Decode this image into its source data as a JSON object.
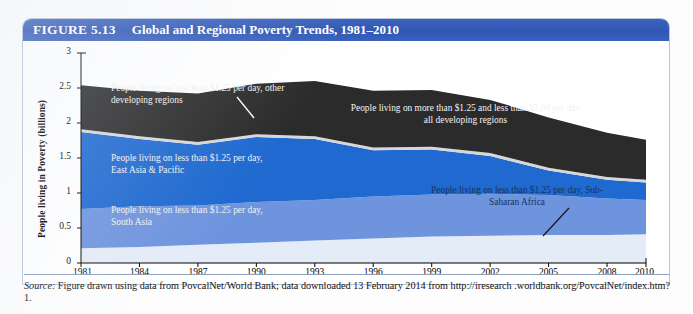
{
  "figure": {
    "label": "FIGURE 5.13",
    "title": "Global and Regional Poverty Trends, 1981–2010"
  },
  "source": {
    "prefix": "Source:",
    "text": " Figure drawn using data from PovcalNet/World Bank; data downloaded 13 February 2014 from http://iresearch .worldbank.org/PovcalNet/index.htm?1."
  },
  "colors": {
    "title_bar": "#2f56b4",
    "other_developing": "#2b2b2b",
    "separator_grey": "#d7d7d7",
    "east_asia_pacific": "#1f69d0",
    "south_asia": "#6f94de",
    "sub_saharan_africa": "#e4ecf8",
    "frame": "#b9c4d8"
  },
  "annotations": [
    {
      "name": "annot-other-developing",
      "text": "People living on less than $1.25 per day, other\ndeveloping regions",
      "style": "white",
      "left": 88,
      "top": 42,
      "width": 215,
      "align": "left"
    },
    {
      "name": "annot-above-125-below-200",
      "text": "People living on more than $1.25 and less than $2.00 per day\nall developing regions",
      "style": "white",
      "left": 300,
      "top": 62,
      "width": 285,
      "align": "center"
    },
    {
      "name": "annot-east-asia-pacific",
      "text": "People living on less than $1.25 per day,\nEast Asia & Pacific",
      "style": "white",
      "left": 88,
      "top": 112,
      "width": 215,
      "align": "left"
    },
    {
      "name": "annot-south-asia",
      "text": "People living on less than $1.25 per day,\nSouth Asia",
      "style": "white",
      "left": 88,
      "top": 164,
      "width": 215,
      "align": "left"
    },
    {
      "name": "annot-sub-saharan-africa",
      "text": "People living on less than $1.25 per day, Sub-\nSaharan Africa",
      "style": "dark",
      "left": 370,
      "top": 144,
      "width": 248,
      "align": "center"
    }
  ],
  "leaders": [
    {
      "name": "leader-other-developing",
      "x1": 214,
      "y1": 56,
      "x2": 231,
      "y2": 77
    },
    {
      "name": "leader-sub-saharan-africa",
      "x1": 546,
      "y1": 167,
      "x2": 520,
      "y2": 195
    }
  ],
  "chart_data": {
    "type": "area",
    "stacked": true,
    "title": "Global and Regional Poverty Trends, 1981–2010",
    "xlabel": "",
    "ylabel": "People living in Poverty (billions)",
    "xlim": [
      1981,
      2010
    ],
    "ylim": [
      0,
      3
    ],
    "grid": false,
    "legend_position": "in-plot annotations",
    "y_ticks": [
      "0",
      "0.5",
      "1",
      "1.5",
      "2",
      "2.5",
      "3"
    ],
    "y_tick_values": [
      0,
      0.5,
      1,
      1.5,
      2,
      2.5,
      3
    ],
    "x_ticks": [
      "1981",
      "1984",
      "1987",
      "1990",
      "1993",
      "1996",
      "1999",
      "2002",
      "2005",
      "2008",
      "2010"
    ],
    "x_tick_values": [
      1981,
      1984,
      1987,
      1990,
      1993,
      1996,
      1999,
      2002,
      2005,
      2008,
      2010
    ],
    "x": [
      1981,
      1984,
      1987,
      1990,
      1993,
      1996,
      1999,
      2002,
      2005,
      2008,
      2010
    ],
    "series": [
      {
        "name": "People living on less than $1.25 per day, Sub-Saharan Africa",
        "color": "#e4ecf8",
        "values": [
          0.21,
          0.23,
          0.26,
          0.29,
          0.32,
          0.35,
          0.38,
          0.39,
          0.4,
          0.4,
          0.41
        ]
      },
      {
        "name": "People living on less than $1.25 per day, South Asia",
        "color": "#6f94de",
        "values": [
          0.56,
          0.58,
          0.56,
          0.58,
          0.58,
          0.6,
          0.6,
          0.6,
          0.57,
          0.52,
          0.49
        ]
      },
      {
        "name": "People living on less than $1.25 per day, East Asia & Pacific",
        "color": "#1f69d0",
        "values": [
          1.1,
          0.96,
          0.87,
          0.93,
          0.87,
          0.66,
          0.64,
          0.54,
          0.35,
          0.27,
          0.25
        ]
      },
      {
        "name": "separator",
        "color": "#d7d7d7",
        "values": [
          0.04,
          0.04,
          0.04,
          0.04,
          0.04,
          0.04,
          0.04,
          0.04,
          0.04,
          0.04,
          0.04
        ]
      },
      {
        "name": "People living on more than $1.25 and less than $2.00 per day, all developing regions",
        "color": "#2b2b2b",
        "values": [
          0.63,
          0.65,
          0.69,
          0.72,
          0.79,
          0.81,
          0.81,
          0.76,
          0.72,
          0.63,
          0.57
        ]
      }
    ],
    "stack_tops": {
      "sub_saharan_africa": [
        0.21,
        0.23,
        0.26,
        0.29,
        0.32,
        0.35,
        0.38,
        0.39,
        0.4,
        0.4,
        0.41
      ],
      "south_asia": [
        0.77,
        0.81,
        0.82,
        0.87,
        0.9,
        0.95,
        0.98,
        0.99,
        0.97,
        0.92,
        0.9
      ],
      "east_asia_pacific": [
        1.87,
        1.77,
        1.69,
        1.8,
        1.77,
        1.61,
        1.62,
        1.53,
        1.32,
        1.19,
        1.15
      ],
      "separator": [
        1.91,
        1.81,
        1.73,
        1.84,
        1.81,
        1.65,
        1.66,
        1.57,
        1.36,
        1.23,
        1.19
      ],
      "total": [
        2.54,
        2.46,
        2.42,
        2.56,
        2.6,
        2.46,
        2.47,
        2.33,
        2.08,
        1.86,
        1.76
      ]
    }
  }
}
